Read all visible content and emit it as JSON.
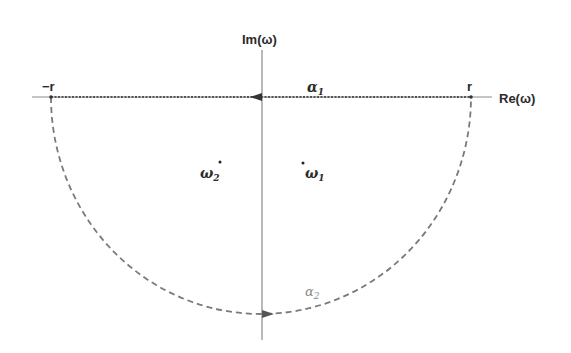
{
  "diagram": {
    "type": "contour-integral-semicircle",
    "axes": {
      "real_label": "Re(ω)",
      "imag_label": "Im(ω)"
    },
    "points": {
      "neg_r_label": "−r",
      "r_label": "r"
    },
    "contours": {
      "alpha1": {
        "symbol": "α",
        "subscript": "1",
        "direction": "leftward along real axis"
      },
      "alpha2": {
        "symbol": "α",
        "subscript": "2",
        "direction": "semicircle in lower half-plane, rightward at bottom"
      }
    },
    "poles": {
      "omega1": {
        "symbol": "ω",
        "subscript": "1",
        "location": "lower-right, inside contour"
      },
      "omega2": {
        "symbol": "ω",
        "subscript": "2",
        "location": "lower-left, inside contour"
      }
    },
    "colors": {
      "axis": "#8a8a8a",
      "contour_line": "#7a7a7a",
      "text": "#2a2a2a",
      "alpha2_text": "#888888"
    }
  }
}
